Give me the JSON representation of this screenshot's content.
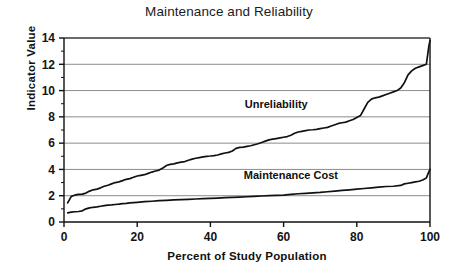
{
  "chart_data": {
    "type": "line",
    "title": "Maintenance and Reliability",
    "xlabel": "Percent of Study Population",
    "ylabel": "Indicator Value",
    "xlim": [
      0,
      100
    ],
    "ylim": [
      0,
      14
    ],
    "xticks": [
      0,
      20,
      40,
      60,
      80,
      100
    ],
    "yticks": [
      0,
      2,
      4,
      6,
      8,
      10,
      12,
      14
    ],
    "y_minor_ticks": [
      1,
      3,
      5,
      7,
      9,
      11,
      13
    ],
    "grid": "horizontal",
    "gridlines_y": [
      2,
      4,
      6,
      8,
      10,
      12,
      14
    ],
    "legend": "inline-annotation",
    "line_color": "#111111",
    "grid_color": "#8c8c8c",
    "axis_color": "#111111",
    "background": "#ffffff",
    "series": [
      {
        "name": "Unreliability",
        "annotation_x": 58,
        "annotation_y": 8.7,
        "x": [
          1.0,
          1.5,
          2.0,
          2.5,
          3.0,
          3.5,
          4.0,
          5.0,
          6.0,
          7.0,
          8.0,
          9.0,
          10.0,
          11.0,
          12.0,
          13.0,
          14.0,
          15.0,
          16.0,
          17.0,
          18.0,
          19.0,
          20.0,
          21.0,
          22.0,
          23.0,
          24.0,
          25.0,
          26.0,
          27.0,
          28.0,
          29.0,
          30.0,
          31.0,
          32.0,
          33.0,
          34.0,
          35.0,
          36.0,
          37.0,
          38.0,
          39.0,
          40.0,
          41.0,
          42.0,
          43.0,
          44.0,
          45.0,
          46.0,
          47.0,
          48.0,
          49.0,
          50.0,
          51.0,
          52.0,
          53.0,
          54.0,
          55.0,
          56.0,
          57.0,
          58.0,
          59.0,
          60.0,
          61.0,
          62.0,
          63.0,
          64.0,
          65.0,
          66.0,
          67.0,
          68.0,
          69.0,
          70.0,
          71.0,
          72.0,
          73.0,
          74.0,
          75.0,
          76.0,
          77.0,
          78.0,
          79.0,
          80.0,
          81.0,
          82.0,
          83.0,
          84.0,
          85.0,
          86.0,
          87.0,
          88.0,
          89.0,
          90.0,
          91.0,
          92.0,
          93.0,
          94.0,
          95.0,
          96.0,
          97.0,
          98.0,
          99.0,
          99.4,
          99.7,
          100.0
        ],
        "y": [
          1.45,
          1.7,
          1.95,
          2.0,
          2.05,
          2.08,
          2.1,
          2.12,
          2.2,
          2.35,
          2.45,
          2.5,
          2.6,
          2.72,
          2.8,
          2.9,
          3.0,
          3.05,
          3.15,
          3.25,
          3.3,
          3.4,
          3.5,
          3.55,
          3.6,
          3.7,
          3.8,
          3.88,
          3.95,
          4.1,
          4.3,
          4.38,
          4.42,
          4.5,
          4.55,
          4.6,
          4.7,
          4.78,
          4.85,
          4.9,
          4.95,
          5.0,
          5.02,
          5.05,
          5.1,
          5.18,
          5.25,
          5.3,
          5.4,
          5.6,
          5.68,
          5.7,
          5.75,
          5.8,
          5.88,
          5.95,
          6.05,
          6.15,
          6.25,
          6.3,
          6.35,
          6.4,
          6.45,
          6.5,
          6.6,
          6.75,
          6.85,
          6.9,
          6.95,
          7.0,
          7.02,
          7.05,
          7.1,
          7.15,
          7.2,
          7.3,
          7.4,
          7.5,
          7.55,
          7.6,
          7.7,
          7.8,
          7.95,
          8.1,
          8.6,
          9.1,
          9.35,
          9.45,
          9.5,
          9.6,
          9.7,
          9.8,
          9.9,
          10.0,
          10.2,
          10.6,
          11.2,
          11.5,
          11.7,
          11.8,
          11.9,
          12.0,
          12.8,
          13.4,
          13.8
        ]
      },
      {
        "name": "Maintenance Cost",
        "annotation_x": 62,
        "annotation_y": 3.3,
        "x": [
          1.0,
          2.0,
          3.0,
          4.0,
          5.0,
          6.0,
          7.0,
          8.0,
          9.0,
          10.0,
          11.0,
          12.0,
          13.0,
          14.0,
          15.0,
          16.0,
          17.0,
          18.0,
          19.0,
          20.0,
          22.0,
          24.0,
          26.0,
          28.0,
          30.0,
          32.0,
          34.0,
          36.0,
          38.0,
          40.0,
          42.0,
          44.0,
          46.0,
          48.0,
          50.0,
          52.0,
          54.0,
          56.0,
          58.0,
          60.0,
          62.0,
          64.0,
          66.0,
          68.0,
          70.0,
          72.0,
          74.0,
          76.0,
          78.0,
          80.0,
          82.0,
          84.0,
          86.0,
          88.0,
          90.0,
          92.0,
          93.0,
          94.0,
          95.0,
          96.0,
          97.0,
          98.0,
          99.0,
          99.5,
          100.0
        ],
        "y": [
          0.7,
          0.75,
          0.78,
          0.8,
          0.85,
          1.0,
          1.08,
          1.12,
          1.15,
          1.2,
          1.25,
          1.28,
          1.3,
          1.33,
          1.36,
          1.4,
          1.42,
          1.45,
          1.48,
          1.5,
          1.55,
          1.58,
          1.62,
          1.65,
          1.68,
          1.7,
          1.72,
          1.75,
          1.78,
          1.8,
          1.82,
          1.85,
          1.88,
          1.9,
          1.92,
          1.95,
          1.98,
          2.0,
          2.02,
          2.05,
          2.1,
          2.15,
          2.18,
          2.22,
          2.25,
          2.3,
          2.35,
          2.4,
          2.45,
          2.5,
          2.55,
          2.6,
          2.65,
          2.7,
          2.72,
          2.78,
          2.9,
          2.95,
          3.0,
          3.05,
          3.1,
          3.2,
          3.35,
          3.7,
          4.0
        ]
      }
    ]
  }
}
